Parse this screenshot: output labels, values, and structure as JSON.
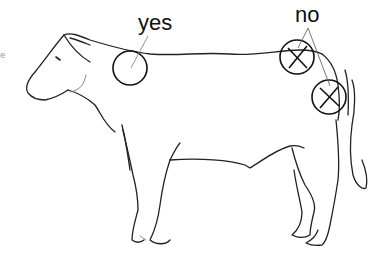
{
  "diagram": {
    "labels": {
      "yes": "yes",
      "no": "no",
      "edge_fragment": "e"
    },
    "markers": [
      {
        "type": "circle",
        "label": "yes",
        "cx": 130,
        "cy": 68,
        "r": 17
      },
      {
        "type": "circle-cross",
        "label": "no",
        "cx": 297,
        "cy": 57,
        "r": 17
      },
      {
        "type": "circle-cross",
        "label": "no",
        "cx": 329,
        "cy": 97,
        "r": 17
      }
    ],
    "colors": {
      "line": "#222222",
      "pointer": "#888888",
      "background": "#ffffff"
    }
  }
}
